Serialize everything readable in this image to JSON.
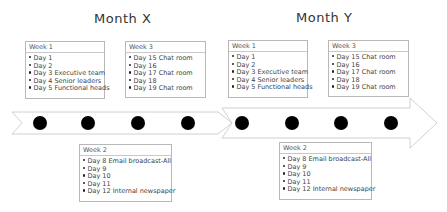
{
  "months": [
    {
      "title": "Month  X"
    },
    {
      "title": "Month  Y"
    }
  ],
  "cards": [
    {
      "id": "x-week1",
      "header": "Week 1",
      "items": [
        "Day 1",
        "Day 2",
        "Day 3 Executive team",
        "Day 4 Senior leaders",
        "Day 5 Functional heads"
      ]
    },
    {
      "id": "x-week3",
      "header": "Week 3",
      "items": [
        "Day 15 Chat room",
        "Day 16",
        "Day 17 Chat room",
        "Day 18",
        "Day 19 Chat room"
      ]
    },
    {
      "id": "x-week2",
      "header": "Week 2",
      "items": [
        "Day 8   Email broadcast-All",
        "Day 9",
        "Day 10",
        "Day 11",
        "Day 12 Internal newspaper"
      ]
    },
    {
      "id": "y-week1",
      "header": "Week 1",
      "items": [
        "Day 1",
        "Day 2",
        "Day 3 Executive team",
        "Day 4 Senior leaders",
        "Day 5 Functional heads"
      ]
    },
    {
      "id": "y-week3",
      "header": "Week 3",
      "items": [
        "Day 15 Chat room",
        "Day 16",
        "Day 17 Chat room",
        "Day 18",
        "Day 19 Chat room"
      ]
    },
    {
      "id": "y-week2",
      "header": "Week 2",
      "items": [
        "Day 8   Email broadcast-All",
        "Day 9",
        "Day 10",
        "Day 11",
        "Day 12 Internal newspaper"
      ]
    }
  ],
  "timeline": {
    "milestones_month_x": 4,
    "milestones_month_y": 4,
    "dot_color": "#000000",
    "arrow_stroke": "#c8c8c8"
  }
}
